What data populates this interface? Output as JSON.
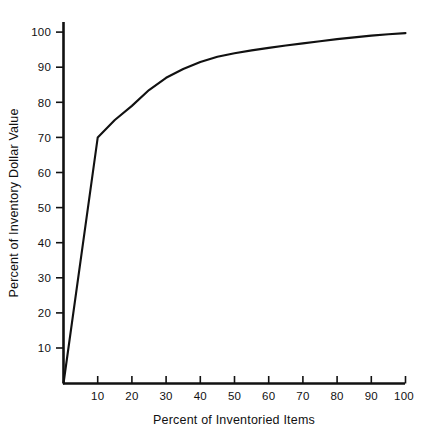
{
  "figure": {
    "background_color": "#ffffff",
    "ink_color": "#111111"
  },
  "axis": {
    "y_title": "Percent of Inventory Dollar Value",
    "x_title": "Percent of Inventoried Items",
    "y_ticks": [
      "10",
      "20",
      "30",
      "40",
      "50",
      "60",
      "70",
      "80",
      "90",
      "100"
    ],
    "x_ticks": [
      "10",
      "20",
      "30",
      "40",
      "50",
      "60",
      "70",
      "80",
      "90",
      "100"
    ]
  },
  "chart_data": {
    "type": "line",
    "title": "",
    "subtitle": "",
    "xlabel": "Percent of Inventoried Items",
    "ylabel": "Percent of Inventory Dollar Value",
    "xlim": [
      0,
      100
    ],
    "ylim": [
      0,
      100
    ],
    "xticks": [
      10,
      20,
      30,
      40,
      50,
      60,
      70,
      80,
      90,
      100
    ],
    "yticks": [
      10,
      20,
      30,
      40,
      50,
      60,
      70,
      80,
      90,
      100
    ],
    "grid": false,
    "legend": null,
    "legend_position": "none",
    "annotations": [],
    "series": [
      {
        "name": "Cumulative inventory dollar value",
        "x": [
          0,
          10,
          15,
          20,
          25,
          30,
          35,
          40,
          45,
          50,
          55,
          60,
          65,
          70,
          75,
          80,
          85,
          90,
          95,
          100
        ],
        "values": [
          0,
          70,
          75,
          79,
          83.5,
          87,
          89.5,
          91.5,
          93,
          94,
          94.8,
          95.5,
          96.2,
          96.8,
          97.4,
          98,
          98.5,
          99,
          99.4,
          99.7
        ]
      }
    ]
  }
}
